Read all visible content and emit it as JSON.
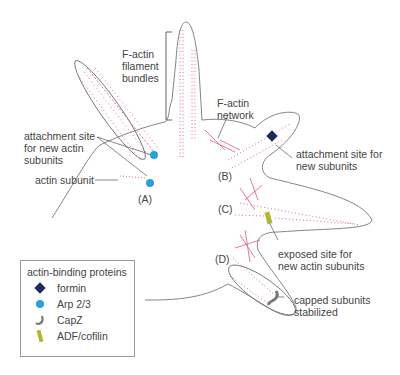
{
  "labels": {
    "filament_bundles": "F-actin\nfilament\nbundles",
    "network": "F-actin\nnetwork",
    "attach_new_actin": "attachment site\nfor new actin\nsubunits",
    "actin_subunit": "actin subunit",
    "attach_new_subunits": "attachment site for\nnew subunits",
    "exposed_site": "exposed site for\nnew actin subunits",
    "capped": "capped subunits\nstabilized",
    "A": "(A)",
    "B": "(B)",
    "C": "(C)",
    "D": "(D)"
  },
  "legend": {
    "title": "actin-binding proteins",
    "items": [
      {
        "label": "formin",
        "icon": "diamond-icon",
        "color": "#1b2a5e"
      },
      {
        "label": "Arp 2/3",
        "icon": "circle-icon",
        "color": "#2a9fdc"
      },
      {
        "label": "CapZ",
        "icon": "hook-icon",
        "color": "#7a7a7a"
      },
      {
        "label": "ADF/cofilin",
        "icon": "rod-icon",
        "color": "#b5b534"
      }
    ]
  },
  "colors": {
    "filament": "#e0577f",
    "outline": "#777777"
  }
}
